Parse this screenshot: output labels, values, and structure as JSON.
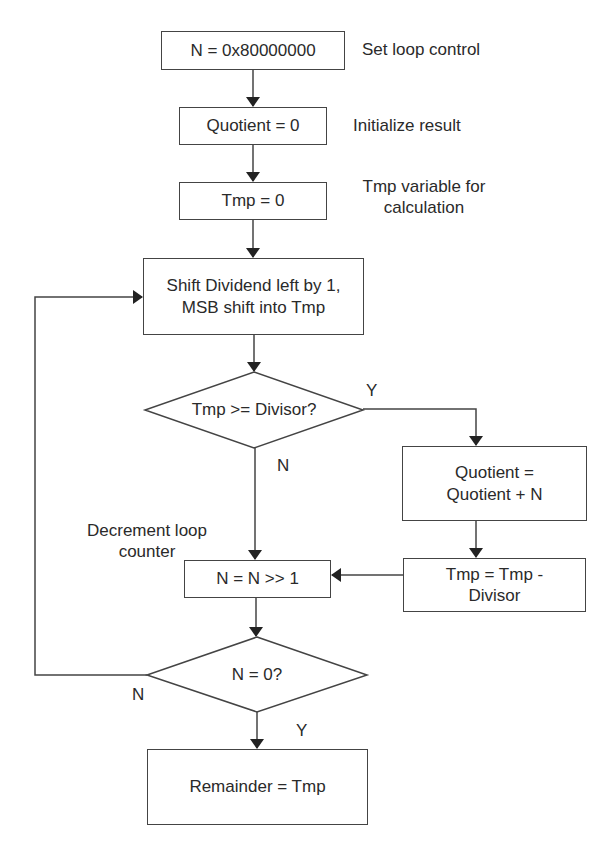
{
  "nodes": {
    "init_n": "N = 0x80000000",
    "init_quotient": "Quotient = 0",
    "init_tmp": "Tmp = 0",
    "shift": "Shift Dividend left by 1, MSB shift into Tmp",
    "decision_divisor": "Tmp >= Divisor?",
    "quotient_add": "Quotient = Quotient + N",
    "tmp_sub": "Tmp = Tmp - Divisor",
    "shift_n": "N = N >> 1",
    "decision_zero": "N = 0?",
    "remainder": "Remainder = Tmp"
  },
  "annotations": {
    "set_loop": "Set loop control",
    "init_result": "Initialize result",
    "tmp_var": "Tmp variable for calculation",
    "decrement": "Decrement loop counter"
  },
  "edge_labels": {
    "divisor_yes": "Y",
    "divisor_no": "N",
    "zero_no": "N",
    "zero_yes": "Y"
  }
}
